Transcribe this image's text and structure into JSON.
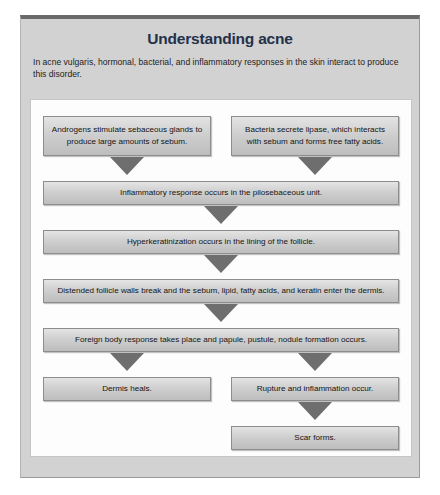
{
  "figure": {
    "title": "Understanding acne",
    "intro": "In acne vulgaris, hormonal, bacterial, and inflammatory responses in the skin interact to produce this disorder."
  },
  "flowchart": {
    "type": "diagram",
    "orientation": "top-to-bottom",
    "nodes": [
      {
        "id": "androgens",
        "label": "Androgens stimulate sebaceous glands to produce large amounts of sebum."
      },
      {
        "id": "bacteria",
        "label": "Bacteria secrete lipase, which interacts with sebum and forms free fatty acids."
      },
      {
        "id": "inflammatory",
        "label": "Inflammatory response occurs in the pilosebaceous unit."
      },
      {
        "id": "hyperkeratinization",
        "label": "Hyperkeratinization occurs in the lining of the follicle."
      },
      {
        "id": "distended",
        "label": "Distended follicle walls break and the sebum, lipid, fatty acids, and keratin enter the dermis."
      },
      {
        "id": "foreign-body",
        "label": "Foreign body response takes place and papule, pustule, nodule formation occurs."
      },
      {
        "id": "dermis-heals",
        "label": "Dermis heals."
      },
      {
        "id": "rupture",
        "label": "Rupture and inflammation occur."
      },
      {
        "id": "scar",
        "label": "Scar forms."
      }
    ],
    "edges": [
      {
        "from": "androgens",
        "to": "inflammatory"
      },
      {
        "from": "bacteria",
        "to": "inflammatory"
      },
      {
        "from": "inflammatory",
        "to": "hyperkeratinization"
      },
      {
        "from": "hyperkeratinization",
        "to": "distended"
      },
      {
        "from": "distended",
        "to": "foreign-body"
      },
      {
        "from": "foreign-body",
        "to": "dermis-heals"
      },
      {
        "from": "foreign-body",
        "to": "rupture"
      },
      {
        "from": "rupture",
        "to": "scar"
      }
    ]
  },
  "colors": {
    "title": "#23314a",
    "frame_background": "#d2d2d2",
    "panel_background": "#fdfdfd",
    "box_fill": "#cfcfcf",
    "arrow_fill": "#6e6e6e"
  }
}
